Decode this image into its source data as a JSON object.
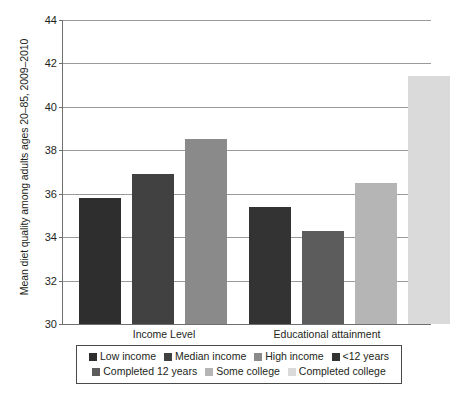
{
  "chart_data": {
    "type": "bar",
    "title": "",
    "xlabel": "",
    "ylabel": "Mean diet quality among adults ages 20–85, 2009–2010",
    "ylim": [
      30,
      44
    ],
    "yticks": [
      30,
      32,
      34,
      36,
      38,
      40,
      42,
      44
    ],
    "ytick_labels": [
      "30",
      "32",
      "34",
      "36",
      "38",
      "40",
      "42",
      "44"
    ],
    "grid": true,
    "legend_position": "bottom",
    "groups": [
      {
        "name": "Income Level",
        "label": "Income Level"
      },
      {
        "name": "Educational attainment",
        "label": "Educational attainment"
      }
    ],
    "categories": [
      "Low income",
      "Median income",
      "High income",
      "<12 years",
      "Completed 12 years",
      "Some college",
      "Completed college"
    ],
    "values": [
      35.8,
      36.9,
      38.5,
      35.4,
      34.3,
      36.5,
      41.4
    ],
    "colors": [
      "#2e2e2e",
      "#414141",
      "#8a8a8a",
      "#333333",
      "#5c5c5c",
      "#b5b5b5",
      "#dadada"
    ],
    "bars": [
      {
        "label": "Low income",
        "value": 35.8,
        "color": "#2e2e2e",
        "group": "Income Level"
      },
      {
        "label": "Median income",
        "value": 36.9,
        "color": "#414141",
        "group": "Income Level"
      },
      {
        "label": "High income",
        "value": 38.5,
        "color": "#8a8a8a",
        "group": "Income Level"
      },
      {
        "label": "<12 years",
        "value": 35.4,
        "color": "#333333",
        "group": "Educational attainment"
      },
      {
        "label": "Completed 12 years",
        "value": 34.3,
        "color": "#5c5c5c",
        "group": "Educational attainment"
      },
      {
        "label": "Some college",
        "value": 36.5,
        "color": "#b5b5b5",
        "group": "Educational attainment"
      },
      {
        "label": "Completed college",
        "value": 41.4,
        "color": "#dadada",
        "group": "Educational attainment"
      }
    ]
  },
  "legend": {
    "row1": [
      {
        "label": "Low income",
        "color": "#2e2e2e"
      },
      {
        "label": "Median income",
        "color": "#414141"
      },
      {
        "label": "High income",
        "color": "#8a8a8a"
      },
      {
        "label": "<12 years",
        "color": "#333333"
      }
    ],
    "row2": [
      {
        "label": "Completed 12 years",
        "color": "#5c5c5c"
      },
      {
        "label": "Some college",
        "color": "#b5b5b5"
      },
      {
        "label": "Completed college",
        "color": "#dadada"
      }
    ]
  },
  "axes": {
    "y_title": "Mean diet quality among adults ages 20–85, 2009–2010"
  }
}
